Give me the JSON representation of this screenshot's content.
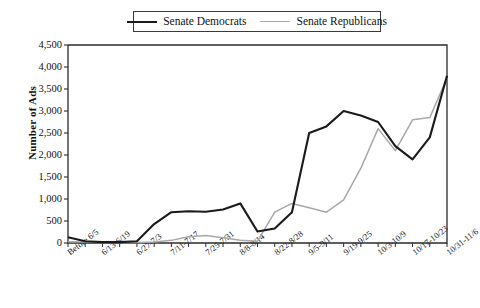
{
  "legend": {
    "position": "top-center",
    "entries": [
      {
        "label": "Senate Democrats",
        "color": "#1a1a1a",
        "swatch": "line-swatch-democrats"
      },
      {
        "label": "Senate Republicans",
        "color": "#a8a8a8",
        "swatch": "line-swatch-republicans"
      }
    ]
  },
  "axes": {
    "ylabel": "Number of Ads",
    "yticks": [
      "0",
      "500",
      "1,000",
      "1,500",
      "2,000",
      "2,500",
      "3,000",
      "3,500",
      "4,000",
      "4,500"
    ],
    "xticks_visible": [
      "Before 6/5",
      "6/13-6/19",
      "6/27-7/3",
      "7/11-7/17",
      "7/25-7/31",
      "8/8-8/14",
      "8/22-8/28",
      "9/5-9/11",
      "9/19-9/25",
      "10/3-10/9",
      "10/17-10/23",
      "10/31-11/6"
    ]
  },
  "chart_data": {
    "type": "line",
    "title": "",
    "xlabel": "",
    "ylabel": "Number of Ads",
    "ylim": [
      0,
      4500
    ],
    "ytick_step": 500,
    "grid": false,
    "legend_position": "top-center",
    "categories": [
      "Before 6/5",
      "6/6-6/12",
      "6/13-6/19",
      "6/20-6/26",
      "6/27-7/3",
      "7/4-7/10",
      "7/11-7/17",
      "7/18-7/24",
      "7/25-7/31",
      "8/1-8/7",
      "8/8-8/14",
      "8/15-8/21",
      "8/22-8/28",
      "8/29-9/4",
      "9/5-9/11",
      "9/12-9/18",
      "9/19-9/25",
      "9/26-10/2",
      "10/3-10/9",
      "10/10-10/16",
      "10/17-10/23",
      "10/24-10/30",
      "10/31-11/6"
    ],
    "series": [
      {
        "name": "Senate Democrats",
        "color": "#1a1a1a",
        "values": [
          130,
          40,
          20,
          20,
          40,
          430,
          700,
          720,
          710,
          760,
          900,
          260,
          330,
          700,
          2500,
          2650,
          3000,
          2900,
          2750,
          2200,
          1900,
          2400,
          3800
        ]
      },
      {
        "name": "Senate Republicans",
        "color": "#a8a8a8",
        "values": [
          30,
          20,
          10,
          10,
          10,
          20,
          60,
          140,
          170,
          120,
          60,
          40,
          700,
          900,
          800,
          700,
          980,
          1700,
          2600,
          2100,
          2800,
          2850,
          3750
        ]
      }
    ]
  }
}
